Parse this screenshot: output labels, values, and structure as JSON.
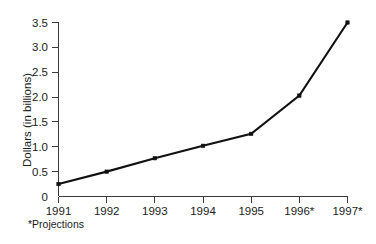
{
  "chart_data": {
    "type": "line",
    "title": "",
    "subtitle": "",
    "xlabel": "",
    "ylabel": "Dollars (in billions)",
    "categories": [
      "1991",
      "1992",
      "1993",
      "1994",
      "1995",
      "1996*",
      "1997*"
    ],
    "values": [
      0.25,
      0.5,
      0.77,
      1.02,
      1.26,
      2.03,
      3.5
    ],
    "series": [
      {
        "name": "Dollars (in billions)",
        "values": [
          0.25,
          0.5,
          0.77,
          1.02,
          1.26,
          2.03,
          3.5
        ]
      }
    ],
    "ylim": [
      0,
      3.5
    ],
    "yticks": [
      0,
      0.5,
      1.0,
      1.5,
      2.0,
      2.5,
      3.0,
      3.5
    ],
    "ytick_labels": [
      "0",
      "0.5",
      "1.0",
      "1.5",
      "2.0",
      "2.5",
      "3.0",
      "3.5"
    ],
    "xtick_labels": [
      "1991",
      "1992",
      "1993",
      "1994",
      "1995",
      "1996*",
      "1997*"
    ],
    "grid": false,
    "legend": false,
    "legend_position": "none",
    "annotations": [
      "*Projections"
    ],
    "marker": "square",
    "line_color": "#111111",
    "axis_color": "#3a3a3a",
    "background_color": "#ffffff"
  },
  "axes": {
    "y_title": "Dollars (in billions)",
    "y_ticks": [
      {
        "label": "3.5",
        "value": 3.5
      },
      {
        "label": "3.0",
        "value": 3.0
      },
      {
        "label": "2.5",
        "value": 2.5
      },
      {
        "label": "2.0",
        "value": 2.0
      },
      {
        "label": "1.5",
        "value": 1.5
      },
      {
        "label": "1.0",
        "value": 1.0
      },
      {
        "label": "0.5",
        "value": 0.5
      },
      {
        "label": "0",
        "value": 0
      }
    ],
    "x_ticks": [
      {
        "label": "1991",
        "value": 0.25
      },
      {
        "label": "1992",
        "value": 0.5
      },
      {
        "label": "1993",
        "value": 0.77
      },
      {
        "label": "1994",
        "value": 1.02
      },
      {
        "label": "1995",
        "value": 1.26
      },
      {
        "label": "1996*",
        "value": 2.03
      },
      {
        "label": "1997*",
        "value": 3.5
      }
    ]
  },
  "footnote": {
    "text": "*Projections"
  }
}
